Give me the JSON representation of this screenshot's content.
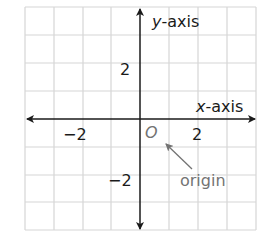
{
  "diagram": {
    "type": "coordinate-plane",
    "grid": {
      "columns": 8,
      "rows": 8,
      "color": "#d6d6d6"
    },
    "axes": {
      "color": "#1a1a1a",
      "x_label_var": "x",
      "x_label_rest": "-axis",
      "y_label_var": "y",
      "y_label_rest": "-axis"
    },
    "ticks": {
      "x_neg": "−2",
      "x_pos": "2",
      "y_pos": "2",
      "y_neg": "−2"
    },
    "origin": {
      "symbol": "O",
      "label": "origin",
      "color": "#737373"
    }
  }
}
